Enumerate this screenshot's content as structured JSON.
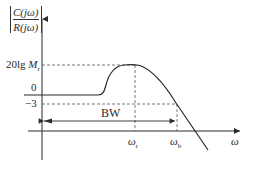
{
  "diagram": {
    "y_axis_label": {
      "numerator": "C(jω)",
      "denominator": "R(jω)"
    },
    "y_ticks": [
      {
        "label_prefix": "20lg ",
        "label_var": "M",
        "label_sub": "r"
      },
      {
        "label": "0"
      },
      {
        "label": "−3"
      }
    ],
    "x_axis_label": "ω",
    "x_ticks": [
      {
        "var": "ω",
        "sub": "r"
      },
      {
        "var": "ω",
        "sub": "b"
      }
    ],
    "bandwidth_label": "BW",
    "colors": {
      "line": "#2a2a2a",
      "dash": "#555555",
      "background": "#ffffff"
    }
  }
}
